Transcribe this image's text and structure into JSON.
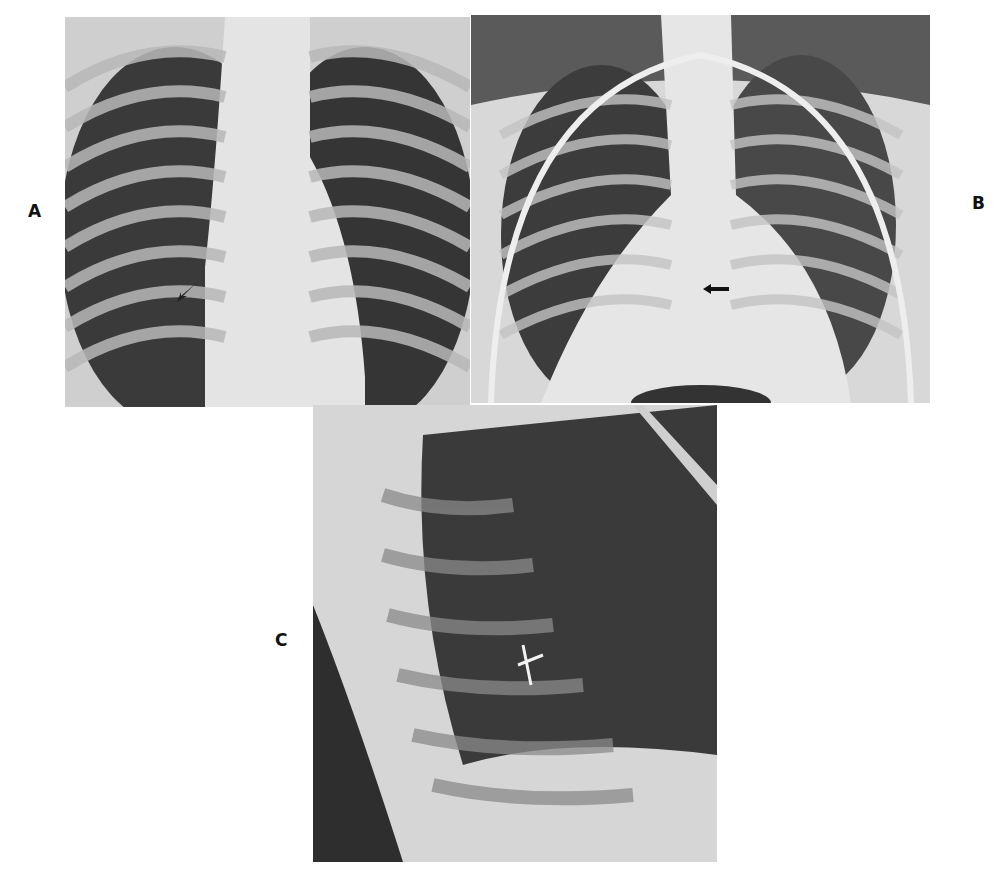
{
  "figure": {
    "panels": [
      {
        "id": "A",
        "label": "A",
        "view": "frontal chest radiograph",
        "arrow": "black arrow pointing at right lower hilum"
      },
      {
        "id": "B",
        "label": "B",
        "view": "frontal chest radiograph",
        "arrow": "black arrow pointing left near cardiac silhouette"
      },
      {
        "id": "C",
        "label": "C",
        "view": "lateral chest radiograph",
        "arrow": "white marker in mid chest"
      }
    ]
  }
}
